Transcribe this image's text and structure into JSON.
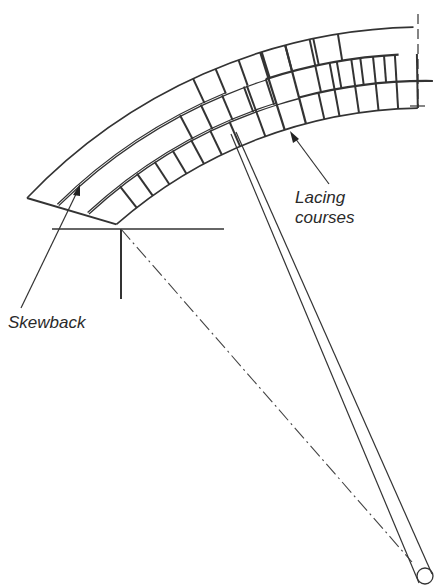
{
  "diagram": {
    "type": "brick-arch-elevation",
    "labels": {
      "skewback": "Skewback",
      "lacing_line1": "Lacing",
      "lacing_line2": "courses"
    },
    "geometry": {
      "center": [
        426,
        578
      ],
      "radii": [
        470,
        497,
        524,
        551
      ],
      "start_angle_deg": 228.8,
      "end_angle_deg": 269.0,
      "ring_count": 3
    },
    "colors": {
      "stroke": "#333333",
      "background": "#ffffff"
    }
  }
}
